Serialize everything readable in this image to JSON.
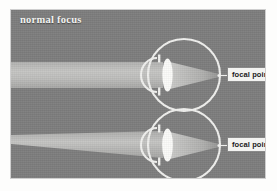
{
  "figure": {
    "title": "normal focus",
    "background_color": "#7e7e7e",
    "beam_color": "#b9b9b7",
    "eye_outline_color": "#f0f0ee",
    "lens_color": "#fbfbf9",
    "callout_bg_color": "#f3f3f1",
    "callout_text_color": "#1a1a1a"
  },
  "diagram_data": {
    "type": "diagram",
    "subject": "human eye optics — normal (emmetropic) focus",
    "panels": [
      {
        "id": "top-eye",
        "ray_source": "distant object",
        "beam_shape": "parallel band",
        "beam_label": "",
        "converges_on": "retina",
        "callout": "focal point"
      },
      {
        "id": "bottom-eye",
        "ray_source": "near object",
        "beam_shape": "diverging wedge",
        "beam_label": "",
        "converges_on": "retina",
        "callout": "focal point"
      }
    ],
    "parts": [
      "eyeball",
      "cornea",
      "lens",
      "focal point"
    ]
  },
  "callouts": {
    "top": "focal point",
    "bottom": "focal point"
  }
}
